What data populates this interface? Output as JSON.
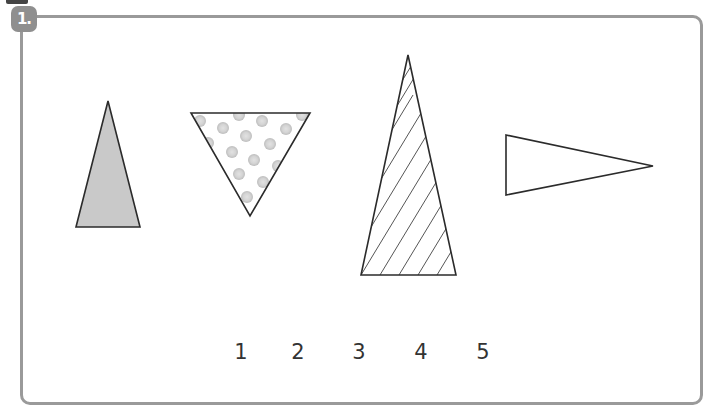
{
  "exercise": {
    "badge_label": "1.",
    "numbers": [
      "1",
      "2",
      "3",
      "4",
      "5"
    ]
  },
  "shapes": [
    {
      "id": "triangle-gray",
      "fill": "solid-gray",
      "color": "#c8c8c8"
    },
    {
      "id": "triangle-dotted",
      "fill": "dots",
      "color": "#d0d0d0"
    },
    {
      "id": "triangle-hatched",
      "fill": "diagonal-lines"
    },
    {
      "id": "triangle-blank",
      "fill": "none"
    }
  ],
  "colors": {
    "frame_border": "#9a9a9a",
    "badge_bg": "#8f8f8f",
    "stroke": "#333333"
  }
}
